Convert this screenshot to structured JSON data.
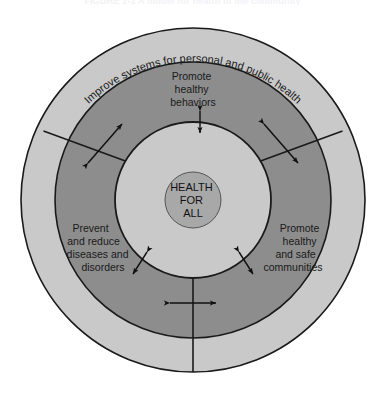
{
  "figure": {
    "title": "FIGURE 1-1  A model for health in the community",
    "colors": {
      "page_background": "#ffffff",
      "outer_ring_fill": "#c9c9c9",
      "middle_ring_fill": "#8d8d8d",
      "inner_circle_fill": "#c9c9c9",
      "core_circle_fill": "#a8a8a8",
      "stroke": "#1a1a1a",
      "text": "#1a1a1a"
    },
    "geometry": {
      "center_x": 193,
      "center_y": 200,
      "outer_radius": 172,
      "middle_radius": 138,
      "inner_radius": 78,
      "core_radius": 28
    }
  },
  "outer_ring": {
    "name": "outer-ring",
    "curved_label": "Improve systems for personal and public health"
  },
  "middle_ring": {
    "name": "middle-ring",
    "segments": [
      {
        "id": "promote-healthy-behaviors",
        "lines": [
          "Promote",
          "healthy",
          "behaviors"
        ],
        "text_x": 193,
        "text_y": 80,
        "anchor": "middle"
      },
      {
        "id": "promote-healthy-and-safe-communities",
        "lines": [
          "Promote",
          "healthy",
          "and safe",
          "communities"
        ],
        "text_x": 300,
        "text_y": 232,
        "anchor": "middle"
      },
      {
        "id": "prevent-and-reduce-diseases-and-disorders",
        "lines": [
          "Prevent",
          "and reduce",
          "diseases and",
          "disorders"
        ],
        "text_x": 96,
        "text_y": 232,
        "anchor": "middle"
      }
    ]
  },
  "core": {
    "name": "health-for-all-core",
    "lines": [
      "HEALTH",
      "FOR",
      "ALL"
    ]
  },
  "arrows": {
    "divider_arrows": [
      {
        "id": "divider-arrow-upper-left",
        "cx": 104,
        "cy": 144,
        "angle": 60,
        "length": 38
      },
      {
        "id": "divider-arrow-upper-right",
        "cx": 282,
        "cy": 144,
        "angle": 120,
        "length": 38
      },
      {
        "id": "divider-arrow-bottom",
        "cx": 193,
        "cy": 308,
        "angle": 90,
        "length": 38
      }
    ],
    "boundary_arrows": [
      {
        "id": "boundary-arrow-top",
        "angle_deg": -90,
        "length": 22
      },
      {
        "id": "boundary-arrow-lower-left",
        "angle_deg": 125,
        "length": 22
      },
      {
        "id": "boundary-arrow-lower-right",
        "angle_deg": 55,
        "length": 22
      }
    ]
  }
}
